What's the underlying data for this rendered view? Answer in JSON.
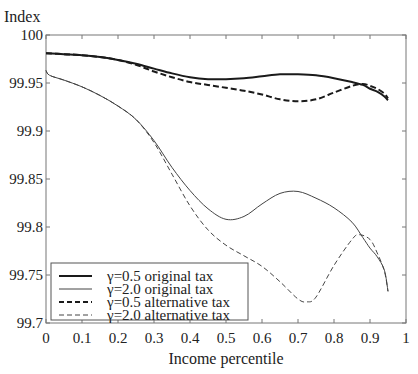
{
  "chart_data": {
    "type": "line",
    "title": "",
    "xlabel": "Income percentile",
    "ylabel": "Index",
    "xlim": [
      0,
      1
    ],
    "ylim": [
      99.7,
      100
    ],
    "xticks": [
      "0",
      "0.1",
      "0.2",
      "0.3",
      "0.4",
      "0.5",
      "0.6",
      "0.7",
      "0.8",
      "0.9",
      "1"
    ],
    "yticks": [
      "100",
      "99.95",
      "99.9",
      "99.85",
      "99.8",
      "99.75",
      "99.7"
    ],
    "grid": false,
    "legend_position": "lower left",
    "series": [
      {
        "name": "γ=0.5 original tax",
        "style": "solid-thick",
        "x": [
          0.0,
          0.05,
          0.1,
          0.15,
          0.2,
          0.25,
          0.3,
          0.35,
          0.4,
          0.45,
          0.5,
          0.55,
          0.6,
          0.65,
          0.7,
          0.75,
          0.8,
          0.85,
          0.88,
          0.9,
          0.92,
          0.94,
          0.95
        ],
        "y": [
          99.981,
          99.98,
          99.979,
          99.977,
          99.974,
          99.97,
          99.965,
          99.96,
          99.956,
          99.954,
          99.954,
          99.955,
          99.957,
          99.959,
          99.959,
          99.958,
          99.955,
          99.951,
          99.948,
          99.944,
          99.941,
          99.936,
          99.932
        ]
      },
      {
        "name": "γ=2.0 original tax",
        "style": "solid-thin",
        "x": [
          0.0,
          0.01,
          0.05,
          0.1,
          0.15,
          0.2,
          0.25,
          0.3,
          0.35,
          0.4,
          0.45,
          0.5,
          0.55,
          0.6,
          0.65,
          0.7,
          0.75,
          0.8,
          0.85,
          0.88,
          0.9,
          0.92,
          0.94,
          0.95
        ],
        "y": [
          99.963,
          99.958,
          99.953,
          99.946,
          99.937,
          99.926,
          99.912,
          99.89,
          99.862,
          99.838,
          99.819,
          99.808,
          99.811,
          99.824,
          99.835,
          99.837,
          99.83,
          99.82,
          99.805,
          99.789,
          99.778,
          99.769,
          99.755,
          99.733
        ]
      },
      {
        "name": "γ=0.5 alternative tax",
        "style": "dashed-thick",
        "x": [
          0.0,
          0.05,
          0.1,
          0.15,
          0.2,
          0.25,
          0.3,
          0.35,
          0.4,
          0.45,
          0.5,
          0.55,
          0.6,
          0.65,
          0.7,
          0.75,
          0.8,
          0.85,
          0.88,
          0.9,
          0.92,
          0.94,
          0.95
        ],
        "y": [
          99.981,
          99.98,
          99.979,
          99.977,
          99.974,
          99.969,
          99.962,
          99.956,
          99.951,
          99.948,
          99.945,
          99.942,
          99.938,
          99.933,
          99.931,
          99.933,
          99.94,
          99.947,
          99.949,
          99.947,
          99.944,
          99.939,
          99.934
        ]
      },
      {
        "name": "γ=2.0 alternative tax",
        "style": "dashed-thin",
        "x": [
          0.0,
          0.01,
          0.05,
          0.1,
          0.15,
          0.2,
          0.25,
          0.3,
          0.35,
          0.4,
          0.45,
          0.5,
          0.55,
          0.6,
          0.65,
          0.7,
          0.725,
          0.75,
          0.8,
          0.85,
          0.87,
          0.9,
          0.92,
          0.94,
          0.95
        ],
        "y": [
          99.963,
          99.958,
          99.953,
          99.946,
          99.937,
          99.926,
          99.912,
          99.888,
          99.855,
          99.822,
          99.797,
          99.781,
          99.77,
          99.759,
          99.743,
          99.725,
          99.722,
          99.727,
          99.76,
          99.787,
          99.792,
          99.787,
          99.773,
          99.754,
          99.733
        ]
      }
    ]
  },
  "legend": {
    "items": [
      {
        "label": "γ=0.5 original tax",
        "style": "solid-thick"
      },
      {
        "label": "γ=2.0 original tax",
        "style": "solid-thin"
      },
      {
        "label": "γ=0.5 alternative tax",
        "style": "dashed-thick"
      },
      {
        "label": "γ=2.0 alternative tax",
        "style": "dashed-thin"
      }
    ]
  },
  "colors": {
    "axis": "#777777",
    "thick_line": "#1a1a1a",
    "thin_line": "#444444"
  }
}
